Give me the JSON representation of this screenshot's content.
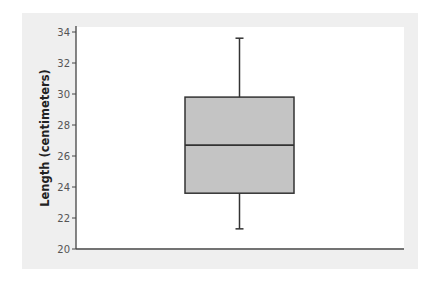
{
  "chart_data": {
    "type": "box",
    "title": "",
    "xlabel": "",
    "ylabel": "Length (centimeters)",
    "ylim": [
      20,
      34
    ],
    "yticks": [
      20,
      22,
      24,
      26,
      28,
      30,
      32,
      34
    ],
    "grid": false,
    "legend": null,
    "boxes": [
      {
        "name": "",
        "whisker_low": 21.3,
        "q1": 23.6,
        "median": 26.7,
        "q3": 29.8,
        "whisker_high": 33.6
      }
    ]
  },
  "colors": {
    "panel_bg": "#efefef",
    "plot_bg": "#ffffff",
    "box_fill": "#c4c4c4",
    "box_stroke": "#333333",
    "axis": "#444444"
  }
}
